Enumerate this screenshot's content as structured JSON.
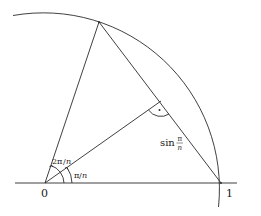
{
  "diagram": {
    "labels": {
      "origin": "0",
      "unit_point": "1",
      "angle_outer": "2π/n",
      "angle_outer_num": "2π",
      "angle_outer_den": "n",
      "angle_inner": "π/n",
      "angle_inner_num": "π",
      "angle_inner_den": "n",
      "half_chord": "sin π/n",
      "half_chord_fn": "sin",
      "half_chord_num": "π",
      "half_chord_den": "n",
      "right_angle_mark": "·"
    },
    "geometry": {
      "origin": [
        45,
        183
      ],
      "radius": 176,
      "unit_point": [
        221,
        183
      ],
      "top_vertex": [
        99,
        22
      ],
      "chord_midpoint": [
        160,
        102
      ],
      "axis_x_range": [
        15,
        237
      ]
    },
    "colors": {
      "stroke": "#2a2a2a",
      "text": "#1a1a1a",
      "background": "#ffffff"
    }
  }
}
